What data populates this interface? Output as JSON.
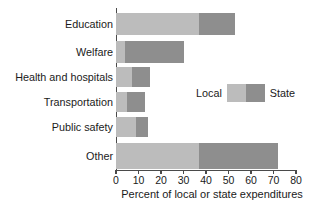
{
  "chart_data": {
    "type": "bar",
    "orientation": "horizontal",
    "stacked": true,
    "title": "",
    "xlabel": "Percent of local or state expenditures",
    "ylabel": "",
    "xlim": [
      0,
      80
    ],
    "ylim": null,
    "grid": false,
    "legend_position": "inside-right",
    "categories": [
      "Education",
      "Welfare",
      "Health and hospitals",
      "Transportation",
      "Public safety",
      "Other"
    ],
    "series": [
      {
        "name": "Local",
        "color": "#bcbcbc",
        "values": [
          37,
          4,
          7,
          5,
          9,
          37
        ]
      },
      {
        "name": "State",
        "color": "#8e8e8e",
        "values": [
          53,
          30,
          15,
          13,
          14,
          72
        ]
      }
    ],
    "xticks": [
      0,
      10,
      20,
      30,
      40,
      50,
      60,
      70,
      80
    ],
    "xtick_labels": [
      "0",
      "10",
      "20",
      "30",
      "40",
      "50",
      "60",
      "70",
      "80"
    ]
  },
  "legend": {
    "local_label": "Local",
    "state_label": "State"
  },
  "axis": {
    "x_title": "Percent of local or state expenditures"
  },
  "colors": {
    "local": "#bcbcbc",
    "state": "#8e8e8e",
    "axis": "#4a4a4a",
    "text": "#1a1a1a",
    "background": "#ffffff"
  }
}
